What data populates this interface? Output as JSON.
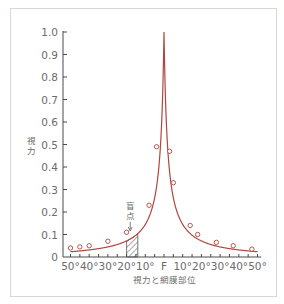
{
  "chart_data": {
    "type": "line",
    "title": "",
    "xlabel": "視力と網膜部位",
    "ylabel": "視力",
    "x_tick_labels": [
      "50°",
      "40°",
      "30°",
      "20°",
      "10°",
      "F",
      "10°",
      "20°",
      "30°",
      "40°",
      "50°"
    ],
    "x_tick_values": [
      -50,
      -40,
      -30,
      -20,
      -10,
      0,
      10,
      20,
      30,
      40,
      50
    ],
    "y_tick_labels": [
      "0",
      "0.1",
      "0.2",
      "0.3",
      "0.4",
      "0.5",
      "0.6",
      "0.7",
      "0.8",
      "0.9",
      "1.0"
    ],
    "ylim": [
      0,
      1.0
    ],
    "xlim": [
      -50,
      50
    ],
    "grid": false,
    "series": [
      {
        "name": "視力",
        "color": "#b0463e",
        "marker": "open-circle",
        "x": [
          -50,
          -45,
          -40,
          -30,
          -20,
          -8,
          -4,
          3,
          5,
          14,
          18,
          28,
          37,
          47
        ],
        "values": [
          0.04,
          0.045,
          0.05,
          0.07,
          0.11,
          0.23,
          0.49,
          0.47,
          0.33,
          0.14,
          0.1,
          0.065,
          0.05,
          0.035
        ]
      }
    ],
    "peak": {
      "x": 0,
      "value": 1.0,
      "label": "F"
    },
    "annotations": [
      {
        "text": "盲点",
        "arrow": "down",
        "x_range": [
          -20,
          -14
        ],
        "style": "hatched"
      }
    ]
  },
  "labels": {
    "y_title": "視力",
    "x_title": "視力と網膜部位",
    "blind_spot": "盲点"
  },
  "colors": {
    "curve": "#b0463e",
    "axis": "#4a4a4a",
    "text": "#6b6b6b",
    "frame": "#dcd6d2"
  }
}
